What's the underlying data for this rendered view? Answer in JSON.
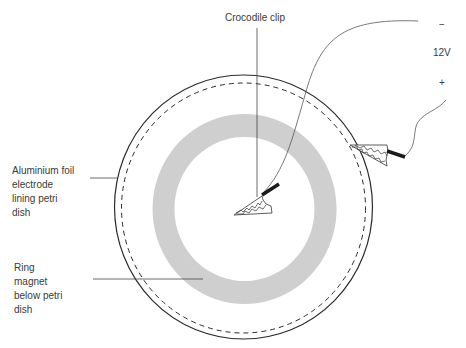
{
  "diagram": {
    "labels": {
      "crocodile_clip": "Crocodile clip",
      "aluminium_foil": [
        "Aluminium foil",
        "electrode",
        "lining petri",
        "dish"
      ],
      "ring_magnet": [
        "Ring",
        "magnet",
        "below petri",
        "dish"
      ],
      "voltage": "12V",
      "negative_terminal": "−",
      "positive_terminal": "+"
    },
    "components": {
      "petri_dish": {
        "shape": "circle",
        "stroke": "#2b2b2b"
      },
      "aluminium_foil_electrode": {
        "shape": "dashed-circle",
        "stroke": "#2b2b2b"
      },
      "ring_magnet": {
        "shape": "annulus",
        "fill": "#cfcfcf"
      },
      "center_crocodile_clip": {
        "handle_color": "#1a1a1a"
      },
      "edge_crocodile_clip": {
        "handle_color": "#1a1a1a"
      },
      "power_supply": {
        "voltage": "12V"
      }
    }
  }
}
